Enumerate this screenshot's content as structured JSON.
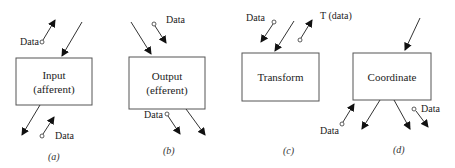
{
  "panels": [
    {
      "id": "a",
      "caption": "(a)",
      "box_line1": "Input",
      "box_line2": "(afferent)",
      "data_labels": [
        "Data",
        "Data"
      ]
    },
    {
      "id": "b",
      "caption": "(b)",
      "box_line1": "Output",
      "box_line2": "(efferent)",
      "data_labels": [
        "Data",
        "Data"
      ]
    },
    {
      "id": "c",
      "caption": "(c)",
      "box_line1": "Transform",
      "box_line2": "",
      "data_labels": [
        "Data",
        "T (data)"
      ]
    },
    {
      "id": "d",
      "caption": "(d)",
      "box_line1": "Coordinate",
      "box_line2": "",
      "data_labels": [
        "Data",
        "Data"
      ]
    }
  ],
  "colors": {
    "line": "#333333",
    "box_border": "#555555"
  }
}
